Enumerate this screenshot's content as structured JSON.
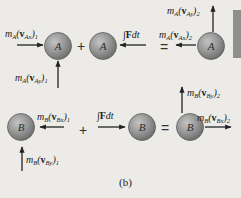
{
  "figure": {
    "caption": "(b)",
    "background": "#ecebe8",
    "ball_color": "#8e8e8e",
    "arrow_color": "#222222"
  },
  "row_a": {
    "balls": [
      {
        "label": "A"
      },
      {
        "label": "A"
      },
      {
        "label": "A"
      }
    ],
    "operators": [
      "+",
      "="
    ],
    "labels": {
      "m_vAx1": {
        "mass": "m",
        "mass_sub": "A",
        "vec": "v",
        "vec_sub": "Ax",
        "index": "1"
      },
      "m_vAy1": {
        "mass": "m",
        "mass_sub": "A",
        "vec": "v",
        "vec_sub": "Ay",
        "index": "1"
      },
      "impulse": {
        "integral": "∫",
        "force": "F",
        "dt": "dt"
      },
      "m_vAx2": {
        "mass": "m",
        "mass_sub": "A",
        "vec": "v",
        "vec_sub": "Ax",
        "index": "2"
      },
      "m_vAy2": {
        "mass": "m",
        "mass_sub": "A",
        "vec": "v",
        "vec_sub": "Ay",
        "index": "2"
      }
    }
  },
  "row_b": {
    "balls": [
      {
        "label": "B"
      },
      {
        "label": "B"
      },
      {
        "label": "B"
      }
    ],
    "operators": [
      "+",
      "="
    ],
    "labels": {
      "m_vBx1": {
        "mass": "m",
        "mass_sub": "B",
        "vec": "v",
        "vec_sub": "Bx",
        "index": "1"
      },
      "m_vBy1": {
        "mass": "m",
        "mass_sub": "B",
        "vec": "v",
        "vec_sub": "By",
        "index": "1"
      },
      "impulse": {
        "integral": "∫",
        "force": "F",
        "dt": "dt"
      },
      "m_vBx2": {
        "mass": "m",
        "mass_sub": "B",
        "vec": "v",
        "vec_sub": "Bx",
        "index": "2"
      },
      "m_vBy2": {
        "mass": "m",
        "mass_sub": "B",
        "vec": "v",
        "vec_sub": "By",
        "index": "2"
      }
    }
  }
}
